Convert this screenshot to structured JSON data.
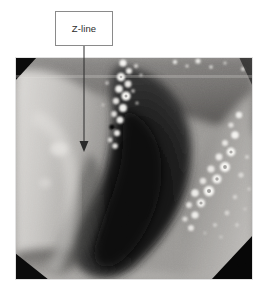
{
  "figure": {
    "type": "annotated-endoscopy-photograph",
    "background_color": "#ffffff",
    "width": 265,
    "height": 291
  },
  "callout": {
    "label": "Z-line",
    "border_color": "#8a8a8a",
    "fill_color": "#ffffff",
    "text_color": "#2b2b2b",
    "box": {
      "x": 55,
      "y": 11,
      "width": 58,
      "height": 35
    }
  },
  "leader": {
    "name": "arrow-pointing-to-z-line",
    "color": "#2b2b2b",
    "x": 84,
    "y_start": 46,
    "y_end": 150,
    "arrowhead": "triangle-down"
  },
  "photo": {
    "name": "esophagogastric-junction-endoscopy-image",
    "alt": "Grayscale endoscopic view of the esophagus showing the Z-line with pale squamous mucosa at left, a dark central lumen, and bright bubble clusters along the mucosal junction.",
    "frame": {
      "x": 15,
      "y": 57,
      "width": 238,
      "height": 223
    },
    "stamp_text": "",
    "palette": {
      "mucosa_light": "#d4d2cf",
      "mucosa_mid": "#a5a3a0",
      "mucosa_shadow": "#6e6c6a",
      "lumen_dark": "#2a2a2a",
      "lumen_deep": "#111111",
      "bubble_bright": "#f2f1ee",
      "vignette": "#0b0b0b"
    }
  }
}
